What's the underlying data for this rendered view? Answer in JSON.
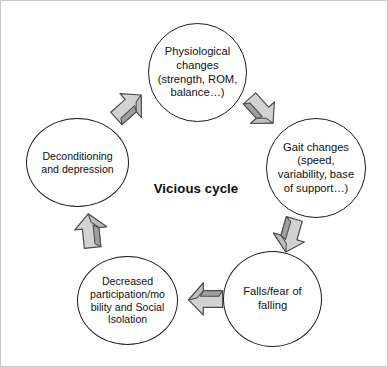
{
  "figure": {
    "title": "Vicious cycle",
    "center_label": "Vicious cycle",
    "border_color": "#c9c9c9",
    "background_color": "#ffffff",
    "node_outline_color": "#1a1a1a",
    "arrow_fill_color": "#d4d4d4",
    "arrow_shade_color": "#9e9e9e",
    "arrow_outline_color": "#4d4d4d"
  },
  "nodes": [
    {
      "id": "physiological",
      "label": "Physiological\nchanges\n(strength, ROM,\nbalance…)",
      "position": "top"
    },
    {
      "id": "gait",
      "label": "Gait changes\n(speed,\nvariability, base\nof support…)",
      "position": "right"
    },
    {
      "id": "falls",
      "label": "Falls/fear of\nfalling",
      "position": "bottom-right"
    },
    {
      "id": "participation",
      "label": "Decreased\nparticipation/mo\nbility and  Social\nIsolation",
      "position": "bottom-left"
    },
    {
      "id": "deconditioning",
      "label": "Deconditioning\nand depression",
      "position": "left"
    }
  ],
  "arrows": [
    {
      "id": "deconditioning-to-physiological",
      "from": "deconditioning",
      "to": "physiological",
      "direction": "up-right"
    },
    {
      "id": "physiological-to-gait",
      "from": "physiological",
      "to": "gait",
      "direction": "down-right"
    },
    {
      "id": "gait-to-falls",
      "from": "gait",
      "to": "falls",
      "direction": "down-left"
    },
    {
      "id": "falls-to-participation",
      "from": "falls",
      "to": "participation",
      "direction": "left"
    },
    {
      "id": "participation-to-deconditioning",
      "from": "participation",
      "to": "deconditioning",
      "direction": "up"
    }
  ]
}
